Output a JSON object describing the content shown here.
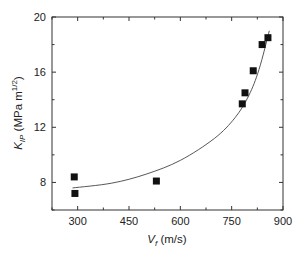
{
  "chart_data": {
    "type": "scatter",
    "title": "",
    "xlabel": "V_f (m/s)",
    "ylabel": "K_IP (MPa m^1/2)",
    "xlabel_parts": {
      "main": "V",
      "sub": "f",
      "unit": " (m/s)"
    },
    "ylabel_parts": {
      "main": "K",
      "sub": "IP",
      "unit_pre": " (MPa m",
      "sup": "1/2",
      "unit_post": ")"
    },
    "xlim": [
      225,
      900
    ],
    "ylim": [
      6,
      20
    ],
    "x_ticks": [
      300,
      450,
      600,
      750,
      900
    ],
    "y_ticks": [
      8,
      12,
      16,
      20
    ],
    "grid": false,
    "legend": null,
    "series": [
      {
        "name": "measured",
        "marker": "square",
        "color": "#111111",
        "points": [
          {
            "x": 290,
            "y": 8.4
          },
          {
            "x": 292,
            "y": 7.2
          },
          {
            "x": 530,
            "y": 8.1
          },
          {
            "x": 781,
            "y": 13.7
          },
          {
            "x": 789,
            "y": 14.5
          },
          {
            "x": 813,
            "y": 16.1
          },
          {
            "x": 839,
            "y": 18.0
          },
          {
            "x": 856,
            "y": 18.5
          }
        ]
      },
      {
        "name": "fit",
        "type": "line",
        "color": "#444444",
        "points": [
          {
            "x": 285,
            "y": 7.6
          },
          {
            "x": 400,
            "y": 7.95
          },
          {
            "x": 500,
            "y": 8.6
          },
          {
            "x": 600,
            "y": 9.6
          },
          {
            "x": 700,
            "y": 11.2
          },
          {
            "x": 760,
            "y": 12.7
          },
          {
            "x": 800,
            "y": 14.3
          },
          {
            "x": 830,
            "y": 16.2
          },
          {
            "x": 860,
            "y": 19.0
          }
        ]
      }
    ]
  }
}
